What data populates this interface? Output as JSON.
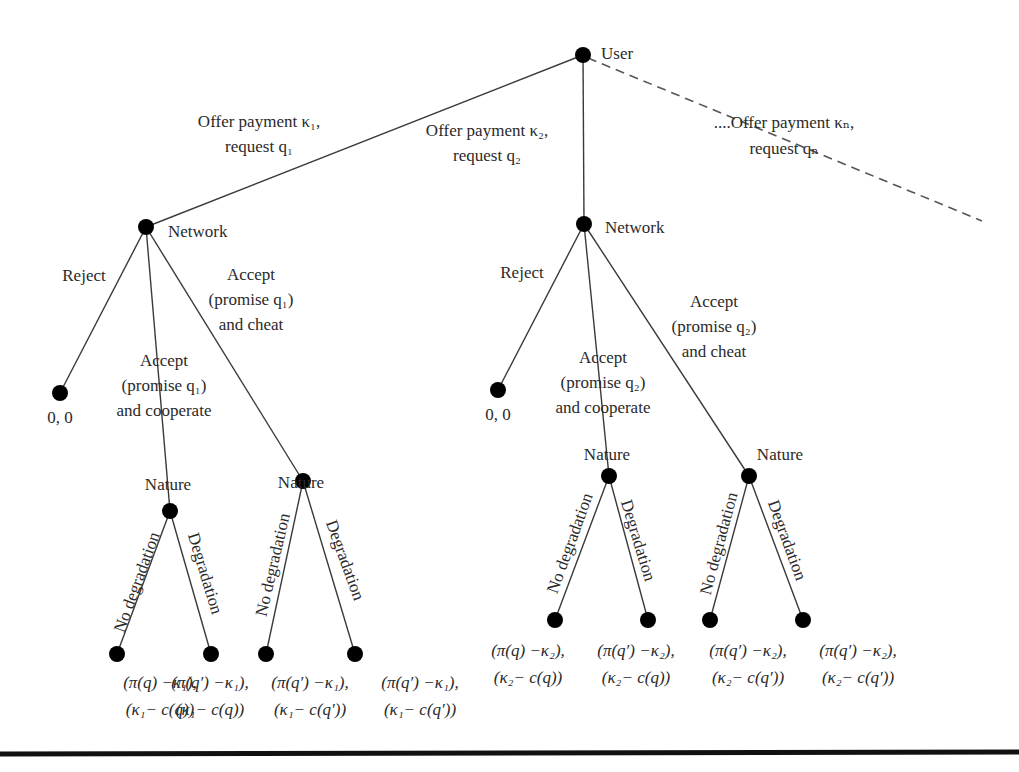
{
  "diagram": {
    "type": "game-tree",
    "nodes": {
      "root": {
        "label": "User"
      },
      "network_1": {
        "label": "Network"
      },
      "network_2": {
        "label": "Network"
      },
      "nature_1": {
        "label": "Nature"
      },
      "nature_2": {
        "label": "Nature"
      },
      "nature_3": {
        "label": "Nature"
      },
      "nature_4": {
        "label": "Nature"
      }
    },
    "user_actions": [
      {
        "line1": "Offer payment κ₁,",
        "line2": "request q₁"
      },
      {
        "line1": "Offer payment κ₂,",
        "line2": "request q₂"
      },
      {
        "line1": "....Offer payment κₙ,",
        "line2": "request qₙ"
      }
    ],
    "network_actions": {
      "reject": "Reject",
      "accept_cooperate_1": [
        "Accept",
        "(promise q₁)",
        "and cooperate"
      ],
      "accept_cheat_1": [
        "Accept",
        "(promise q₁)",
        "and cheat"
      ],
      "accept_cooperate_2": [
        "Accept",
        "(promise q₂)",
        "and cooperate"
      ],
      "accept_cheat_2": [
        "Accept",
        "(promise q₂)",
        "and cheat"
      ]
    },
    "nature_actions": {
      "no_degradation": "No degradation",
      "degradation": "Degradation"
    },
    "reject_payoff": "0, 0",
    "payoffs_left": [
      {
        "user": "(π(q) −κ₁),",
        "network": "(κ₁− c(q))"
      },
      {
        "user": "(π(q′) −κ₁),",
        "network": "(κ₁− c(q))"
      },
      {
        "user": "(π(q′) −κ₁),",
        "network": "(κ₁− c(q′))"
      },
      {
        "user": "(π(q′) −κ₁),",
        "network": "(κ₁− c(q′))"
      }
    ],
    "payoffs_right": [
      {
        "user": "(π(q) −κ₂),",
        "network": "(κ₂− c(q))"
      },
      {
        "user": "(π(q′) −κ₂),",
        "network": "(κ₂− c(q))"
      },
      {
        "user": "(π(q′) −κ₂),",
        "network": "(κ₂− c(q′))"
      },
      {
        "user": "(π(q′) −κ₂),",
        "network": "(κ₂− c(q′))"
      }
    ]
  }
}
